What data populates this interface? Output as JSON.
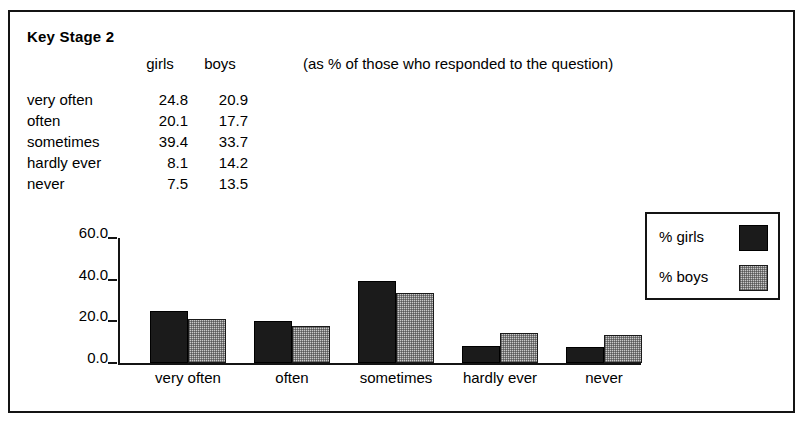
{
  "figure": {
    "title": "Key Stage 2",
    "note": "(as % of those who responded to the question)"
  },
  "table": {
    "columns": [
      "",
      "girls",
      "boys"
    ],
    "col_girls": "girls",
    "col_boys": "boys",
    "rows": [
      {
        "label": "very often",
        "girls": "24.8",
        "boys": "20.9"
      },
      {
        "label": "often",
        "girls": "20.1",
        "boys": "17.7"
      },
      {
        "label": "sometimes",
        "girls": "39.4",
        "boys": "33.7"
      },
      {
        "label": "hardly ever",
        "girls": "8.1",
        "boys": "14.2"
      },
      {
        "label": "never",
        "girls": "7.5",
        "boys": "13.5"
      }
    ]
  },
  "legend": {
    "items": [
      {
        "label": "% girls",
        "color": "#1b1b1b",
        "pattern": "solid-black"
      },
      {
        "label": "% boys",
        "color": "#c9c9c9",
        "pattern": "halftone-gray"
      }
    ]
  },
  "chart_data": {
    "type": "bar",
    "title": "Key Stage 2",
    "subtitle": "(as % of those who responded to the question)",
    "categories": [
      "very often",
      "often",
      "sometimes",
      "hardly ever",
      "never"
    ],
    "series": [
      {
        "name": "% girls",
        "values": [
          24.8,
          20.1,
          39.4,
          8.1,
          7.5
        ],
        "color": "#1b1b1b"
      },
      {
        "name": "% boys",
        "values": [
          20.9,
          17.7,
          33.7,
          14.2,
          13.5
        ],
        "color": "#c9c9c9"
      }
    ],
    "xlabel": "",
    "ylabel": "",
    "ylim": [
      0,
      60
    ],
    "yticks": [
      "0.0",
      "20.0",
      "40.0",
      "60.0"
    ],
    "ytick_values": [
      0,
      20,
      40,
      60
    ],
    "grid": false,
    "legend_position": "right"
  }
}
